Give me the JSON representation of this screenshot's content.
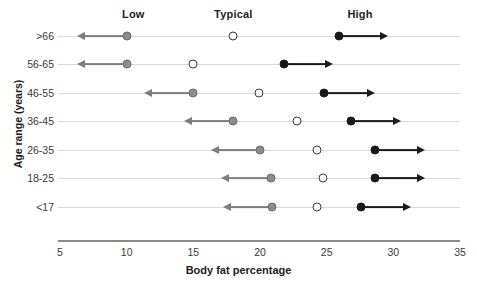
{
  "chart_data": {
    "type": "scatter",
    "title": "",
    "xlabel": "Body fat percentage",
    "ylabel": "Age range (years)",
    "xlim": [
      5,
      35
    ],
    "xticks": [
      5,
      10,
      15,
      20,
      25,
      30,
      35
    ],
    "grid": true,
    "legend_position": "top",
    "categories": [
      ">66",
      "56-65",
      "46-55",
      "36-45",
      "26-35",
      "18-25",
      "<17"
    ],
    "column_headers": [
      "Low",
      "Typical",
      "High"
    ],
    "column_header_positions": [
      10.5,
      18.0,
      27.5
    ],
    "series": [
      {
        "name": "Low",
        "marker": "filled-gray-circle",
        "color": "#8d8d8d",
        "direction": "left-arrow",
        "values": [
          10.0,
          10.0,
          15.0,
          18.0,
          20.0,
          20.8,
          20.9
        ],
        "arrow_ends": [
          6.9,
          6.9,
          11.9,
          14.9,
          16.9,
          17.7,
          17.8
        ]
      },
      {
        "name": "Typical",
        "marker": "open-circle",
        "color": "#ffffff",
        "direction": "none",
        "values": [
          18.0,
          15.0,
          19.9,
          22.8,
          24.3,
          24.7,
          24.3
        ]
      },
      {
        "name": "High",
        "marker": "filled-black-circle",
        "color": "#1a1a1a",
        "direction": "right-arrow",
        "values": [
          25.9,
          21.8,
          24.8,
          26.8,
          28.6,
          28.6,
          27.6
        ],
        "arrow_ends": [
          29.0,
          24.9,
          28.0,
          30.0,
          31.8,
          31.8,
          30.7
        ]
      }
    ]
  },
  "axis": {
    "x_tick_labels": [
      "5",
      "10",
      "15",
      "20",
      "25",
      "30",
      "35"
    ],
    "x_title": "Body fat percentage",
    "y_title": "Age range (years)",
    "y_tick_labels": [
      ">66",
      "56-65",
      "46-55",
      "36-45",
      "26-35",
      "18-25",
      "<17"
    ]
  },
  "headers": {
    "low": "Low",
    "typical": "Typical",
    "high": "High"
  },
  "colors": {
    "low_marker": "#8d8d8d",
    "typical_marker": "#ffffff",
    "high_marker": "#1a1a1a",
    "grid_line": "#d9d9d9",
    "axis_line": "#8a8a8a",
    "text": "#2b2b2b"
  }
}
